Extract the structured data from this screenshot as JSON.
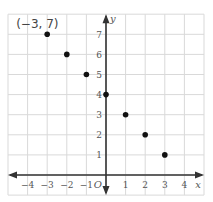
{
  "chart_data": {
    "type": "scatter",
    "title": "",
    "xlabel": "x",
    "ylabel": "y",
    "origin_label": "O",
    "xlim": [
      -5,
      5
    ],
    "ylim": [
      -1,
      8
    ],
    "grid": true,
    "x_ticks": [
      -4,
      -3,
      -2,
      -1,
      1,
      2,
      3,
      4
    ],
    "y_ticks": [
      1,
      2,
      3,
      4,
      5,
      6,
      7
    ],
    "x_tick_labels": [
      "−4",
      "−3",
      "−2",
      "−1",
      "1",
      "2",
      "3",
      "4"
    ],
    "y_tick_labels": [
      "1",
      "2",
      "3",
      "4",
      "5",
      "6",
      "7"
    ],
    "points": [
      {
        "x": -3,
        "y": 7
      },
      {
        "x": -2,
        "y": 6
      },
      {
        "x": -1,
        "y": 5
      },
      {
        "x": 0,
        "y": 4
      },
      {
        "x": 1,
        "y": 3
      },
      {
        "x": 2,
        "y": 2
      },
      {
        "x": 3,
        "y": 1
      }
    ],
    "annotations": [
      {
        "text": "(−3, 7)",
        "x": -3,
        "y": 7
      }
    ],
    "colors": {
      "grid": "#d9d9d9",
      "axis": "#333333",
      "point": "#111111",
      "text": "#555555"
    }
  }
}
